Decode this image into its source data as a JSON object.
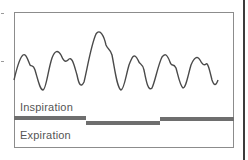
{
  "labels": {
    "inspiration": "Inspiration",
    "expiration": "Expiration"
  },
  "colors": {
    "waveform": "#4a4a4a",
    "bar": "#6e6e6e",
    "frame": "#8c8c8c",
    "edge": "#3c3c3c",
    "text": "#555555"
  },
  "phase_bar": {
    "segments": [
      {
        "phase": "inspiration",
        "x_start": 14,
        "x_end": 86
      },
      {
        "phase": "expiration",
        "x_start": 86,
        "x_end": 160
      },
      {
        "phase": "inspiration",
        "x_start": 160,
        "x_end": 235
      }
    ]
  }
}
